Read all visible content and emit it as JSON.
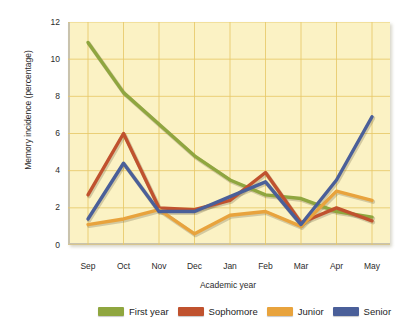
{
  "chart_data": {
    "type": "line",
    "title": "",
    "xlabel": "Academic year",
    "ylabel": "Memory incidence (percentage)",
    "categories": [
      "Sep",
      "Oct",
      "Nov",
      "Dec",
      "Jan",
      "Feb",
      "Mar",
      "Apr",
      "May"
    ],
    "xticks": [
      "Sep",
      "Oct",
      "Nov",
      "Dec",
      "Jan",
      "Feb",
      "Mar",
      "Apr",
      "May"
    ],
    "yticks": [
      "0",
      "2",
      "4",
      "6",
      "8",
      "10",
      "12"
    ],
    "ylim": [
      0,
      12
    ],
    "grid": true,
    "legend_position": "bottom",
    "series": [
      {
        "name": "First year",
        "color": "#8fa63f",
        "values": [
          10.9,
          8.2,
          6.5,
          4.8,
          3.5,
          2.7,
          2.5,
          1.8,
          1.5
        ]
      },
      {
        "name": "Sophomore",
        "color": "#c0522e",
        "values": [
          2.7,
          6.0,
          2.0,
          1.9,
          2.4,
          3.9,
          1.2,
          2.0,
          1.3
        ]
      },
      {
        "name": "Junior",
        "color": "#e8a33d",
        "values": [
          1.1,
          1.4,
          1.9,
          0.6,
          1.6,
          1.8,
          1.0,
          2.9,
          2.4
        ]
      },
      {
        "name": "Senior",
        "color": "#4a5f99",
        "values": [
          1.4,
          4.4,
          1.8,
          1.8,
          2.6,
          3.4,
          1.1,
          3.5,
          6.9
        ]
      }
    ]
  },
  "colors": {
    "plot_background": "#fbf2c4",
    "grid": "#e8c96a",
    "axis": "#c9c3ad",
    "page_background": "#ffffff",
    "text": "#2b2b2b"
  }
}
